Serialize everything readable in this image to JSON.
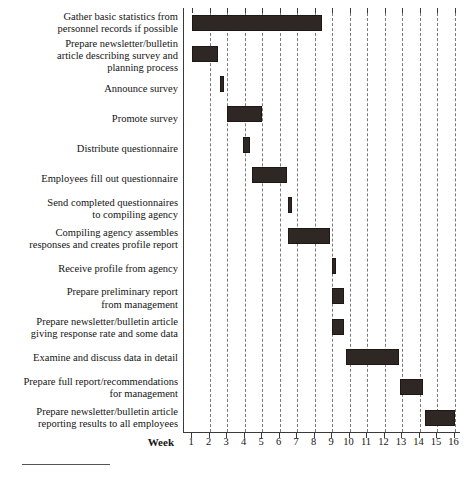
{
  "chart_data": {
    "type": "bar",
    "subtype": "gantt",
    "title": "",
    "xlabel": "Week",
    "ylabel": "",
    "xlim": [
      1,
      16
    ],
    "xticks": [
      1,
      2,
      3,
      4,
      5,
      6,
      7,
      8,
      9,
      10,
      11,
      12,
      13,
      14,
      15,
      16
    ],
    "xtick_labels": [
      "1",
      "2",
      "3",
      "4",
      "5",
      "6",
      "7",
      "8",
      "9",
      "10",
      "11",
      "12",
      "13",
      "14",
      "15",
      "16"
    ],
    "grid": "vertical-dashed",
    "legend": "none",
    "bar_color": "#2e2723",
    "categories": [
      "Gather basic statistics from personnel records if possible",
      "Prepare newsletter/bulletin article describing survey and planning process",
      "Announce survey",
      "Promote survey",
      "Distribute questionnaire",
      "Employees fill out questionnaire",
      "Send completed questionnaires to compiling agency",
      "Compiling agency assembles responses and creates profile report",
      "Receive profile from agency",
      "Prepare preliminary report from management",
      "Prepare newsletter/bulletin article giving response rate and some data",
      "Examine and discuss data in detail",
      "Prepare full report/recommendations for management",
      "Prepare newsletter/bulletin article reporting results to all employees"
    ],
    "tasks": [
      {
        "label": "Gather basic statistics from\npersonnel records if possible",
        "start": 1.0,
        "end": 8.4
      },
      {
        "label": "Prepare newsletter/bulletin\narticle describing survey and\nplanning process",
        "start": 1.0,
        "end": 2.5
      },
      {
        "label": "Announce survey",
        "start": 2.6,
        "end": 2.85
      },
      {
        "label": "Promote survey",
        "start": 3.0,
        "end": 5.0
      },
      {
        "label": "Distribute questionnaire",
        "start": 3.9,
        "end": 4.3
      },
      {
        "label": "Employees fill out questionnaire",
        "start": 4.4,
        "end": 6.4
      },
      {
        "label": "Send completed questionnaires\nto compiling agency",
        "start": 6.5,
        "end": 6.7
      },
      {
        "label": "Compiling agency assembles\nresponses and creates profile report",
        "start": 6.5,
        "end": 8.9
      },
      {
        "label": "Receive profile from agency",
        "start": 9.0,
        "end": 9.25
      },
      {
        "label": "Prepare preliminary report\nfrom management",
        "start": 9.0,
        "end": 9.7
      },
      {
        "label": "Prepare newsletter/bulletin article\ngiving response rate and some data",
        "start": 9.0,
        "end": 9.7
      },
      {
        "label": "Examine and discuss data in detail",
        "start": 9.8,
        "end": 12.8
      },
      {
        "label": "Prepare full report/recommendations\nfor management",
        "start": 12.9,
        "end": 14.2
      },
      {
        "label": "Prepare newsletter/bulletin article\nreporting results to all employees",
        "start": 14.3,
        "end": 16.0
      }
    ]
  },
  "axis": {
    "week_caption": "Week"
  }
}
